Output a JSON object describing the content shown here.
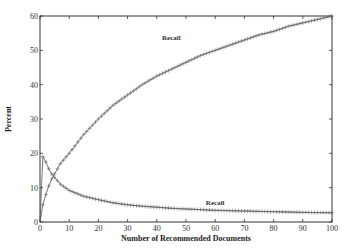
{
  "chart_data": {
    "type": "line",
    "title": "",
    "xlabel": "Number of Recommended Documents",
    "ylabel": "Percent",
    "xlim": [
      0,
      100
    ],
    "ylim": [
      0,
      60
    ],
    "xticks": [
      0,
      10,
      20,
      30,
      40,
      50,
      60,
      70,
      80,
      90,
      100
    ],
    "yticks": [
      0,
      10,
      20,
      30,
      40,
      50,
      60
    ],
    "grid": false,
    "legend": "none (inline labels)",
    "marker": "+",
    "series": [
      {
        "name": "Recall",
        "label_position": {
          "x": 45,
          "y": 53
        },
        "x": [
          1,
          2,
          3,
          4,
          5,
          7,
          10,
          15,
          20,
          25,
          30,
          35,
          40,
          45,
          50,
          55,
          60,
          65,
          70,
          75,
          80,
          85,
          90,
          95,
          100
        ],
        "values": [
          5,
          8,
          10.5,
          12.5,
          14,
          17,
          20,
          25.5,
          30,
          34,
          37,
          40,
          42.5,
          44.5,
          46.5,
          48.5,
          50,
          51.5,
          53,
          54.5,
          55.5,
          57,
          58,
          59,
          60
        ]
      },
      {
        "name": "Recall",
        "label_position": {
          "x": 60,
          "y": 5
        },
        "x": [
          1,
          2,
          3,
          4,
          5,
          7,
          10,
          15,
          20,
          25,
          30,
          35,
          40,
          45,
          50,
          55,
          60,
          65,
          70,
          75,
          80,
          85,
          90,
          95,
          100
        ],
        "values": [
          19,
          17.5,
          15.5,
          14,
          13,
          11,
          9.2,
          7.5,
          6.5,
          5.6,
          5,
          4.6,
          4.3,
          4,
          3.8,
          3.6,
          3.4,
          3.3,
          3.2,
          3.1,
          3,
          2.9,
          2.8,
          2.75,
          2.7
        ]
      }
    ]
  },
  "colors": {
    "axis": "#333333",
    "line": "#555555",
    "marker": "#666666"
  }
}
